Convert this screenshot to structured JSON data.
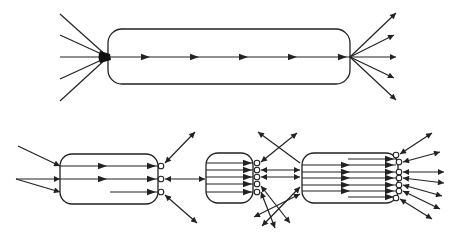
{
  "colors": {
    "stroke": "#222222",
    "background": "#ffffff"
  },
  "top": {
    "box": {
      "x": 108,
      "y": 29,
      "w": 242,
      "h": 55,
      "r": 14
    },
    "hub": {
      "x": 108,
      "y": 57
    },
    "inputs": [
      [
        60,
        14
      ],
      [
        60,
        35
      ],
      [
        60,
        57
      ],
      [
        60,
        79
      ],
      [
        60,
        101
      ]
    ],
    "flow": {
      "y": 57,
      "x1": 108,
      "x2": 350,
      "arrows": [
        150,
        199,
        248,
        297,
        347
      ]
    },
    "outputs": [
      [
        396,
        13
      ],
      [
        394,
        35
      ],
      [
        396,
        57
      ],
      [
        394,
        78
      ],
      [
        396,
        100
      ]
    ],
    "fan_origin": {
      "x": 350,
      "y": 57
    }
  },
  "bottom": {
    "boxes": [
      {
        "name": "stage-1",
        "box": {
          "x": 60,
          "y": 154,
          "w": 98,
          "h": 50,
          "r": 12
        },
        "rows": [
          {
            "y": 166,
            "x1": 60,
            "x2": 158,
            "arrows": [
              107,
              156
            ]
          },
          {
            "y": 179,
            "x1": 60,
            "x2": 158,
            "arrows": [
              107,
              156
            ]
          },
          {
            "y": 192,
            "x1": 110,
            "x2": 158,
            "arrows": [
              156
            ]
          }
        ],
        "ports": [
          [
            161,
            166
          ],
          [
            161,
            179
          ],
          [
            161,
            192
          ]
        ]
      },
      {
        "name": "stage-2",
        "box": {
          "x": 206,
          "y": 153,
          "w": 47,
          "h": 50,
          "r": 12
        },
        "rows": [
          {
            "y": 163,
            "x1": 206,
            "x2": 253,
            "arrows": [
              252
            ]
          },
          {
            "y": 170,
            "x1": 206,
            "x2": 253,
            "arrows": [
              252
            ]
          },
          {
            "y": 177,
            "x1": 206,
            "x2": 253,
            "arrows": [
              252
            ]
          },
          {
            "y": 184,
            "x1": 206,
            "x2": 253,
            "arrows": [
              252
            ]
          },
          {
            "y": 192,
            "x1": 206,
            "x2": 253,
            "arrows": [
              252
            ]
          }
        ],
        "ports": [
          [
            257,
            163
          ],
          [
            257,
            170
          ],
          [
            257,
            177
          ],
          [
            257,
            184
          ],
          [
            257,
            192
          ]
        ]
      },
      {
        "name": "stage-3",
        "box": {
          "x": 302,
          "y": 153,
          "w": 96,
          "h": 50,
          "r": 12
        },
        "rows": [
          {
            "y": 159,
            "x1": 348,
            "x2": 396,
            "arrows": [
              394
            ]
          },
          {
            "y": 165,
            "x1": 302,
            "x2": 396,
            "arrows": [
              350,
              394
            ]
          },
          {
            "y": 172,
            "x1": 302,
            "x2": 396,
            "arrows": [
              350,
              394
            ]
          },
          {
            "y": 178,
            "x1": 302,
            "x2": 396,
            "arrows": [
              350,
              394
            ]
          },
          {
            "y": 185,
            "x1": 302,
            "x2": 396,
            "arrows": [
              350,
              394
            ]
          },
          {
            "y": 191,
            "x1": 302,
            "x2": 396,
            "arrows": [
              350,
              394
            ]
          },
          {
            "y": 197,
            "x1": 348,
            "x2": 396,
            "arrows": [
              394
            ]
          }
        ],
        "ports": [
          [
            396,
            155
          ],
          [
            399,
            162
          ],
          [
            399,
            172
          ],
          [
            399,
            178
          ],
          [
            399,
            185
          ],
          [
            399,
            191
          ],
          [
            396,
            198
          ]
        ]
      }
    ],
    "single_arrows": [
      {
        "from": [
          18,
          146
        ],
        "to": [
          60,
          166
        ]
      },
      {
        "from": [
          16,
          179
        ],
        "to": [
          60,
          179
        ]
      },
      {
        "from": [
          16,
          179
        ],
        "to": [
          60,
          192
        ]
      }
    ],
    "double_arrows": [
      {
        "a": [
          165,
          163
        ],
        "b": [
          195,
          132
        ]
      },
      {
        "a": [
          165,
          179
        ],
        "b": [
          205,
          179
        ]
      },
      {
        "a": [
          165,
          195
        ],
        "b": [
          197,
          223
        ]
      },
      {
        "a": [
          261,
          162
        ],
        "b": [
          297,
          133
        ]
      },
      {
        "a": [
          261,
          170
        ],
        "b": [
          300,
          170
        ]
      },
      {
        "a": [
          261,
          177
        ],
        "b": [
          300,
          177
        ]
      },
      {
        "a": [
          261,
          186
        ],
        "b": [
          290,
          223
        ]
      },
      {
        "a": [
          261,
          192
        ],
        "b": [
          275,
          228
        ]
      },
      {
        "a": [
          300,
          187
        ],
        "b": [
          262,
          226
        ]
      },
      {
        "a": [
          300,
          194
        ],
        "b": [
          254,
          217
        ]
      },
      {
        "a": [
          400,
          154
        ],
        "b": [
          432,
          133
        ]
      },
      {
        "a": [
          403,
          162
        ],
        "b": [
          440,
          152
        ]
      },
      {
        "a": [
          403,
          172
        ],
        "b": [
          444,
          172
        ]
      },
      {
        "a": [
          403,
          178
        ],
        "b": [
          444,
          183
        ]
      },
      {
        "a": [
          403,
          185
        ],
        "b": [
          442,
          196
        ]
      },
      {
        "a": [
          403,
          191
        ],
        "b": [
          440,
          209
        ]
      },
      {
        "a": [
          400,
          199
        ],
        "b": [
          432,
          219
        ]
      }
    ],
    "cross_lines": [
      {
        "from": [
          300,
          163
        ],
        "to": [
          258,
          132
        ],
        "arrow_end": true
      }
    ]
  }
}
